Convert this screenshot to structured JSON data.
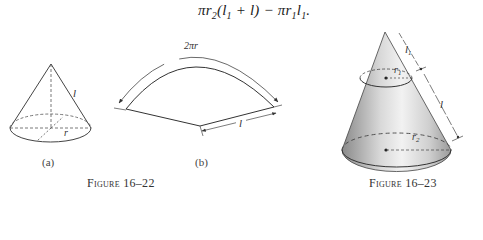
{
  "equation": {
    "pi": "π",
    "r2": "r",
    "r2_sub": "2",
    "open": "(",
    "l1": "l",
    "l1_sub": "1",
    "plus": " + ",
    "l": "l",
    "close": ")",
    "minus": " − ",
    "pi2": "π",
    "r1": "r",
    "r1_sub": "1",
    "l1b": "l",
    "l1b_sub": "1",
    "period": "."
  },
  "figure_16_22": {
    "caption": "Figure 16–22",
    "part_a": {
      "label": "(a)",
      "slant_label": "l",
      "radius_label": "r"
    },
    "part_b": {
      "label": "(b)",
      "arc_label": "2πr",
      "radius_label": "l"
    }
  },
  "figure_16_23": {
    "caption": "Figure 16–23",
    "l1_label": "l₁",
    "l_label": "l",
    "r1_label": "r₁",
    "r2_label": "r₂"
  }
}
